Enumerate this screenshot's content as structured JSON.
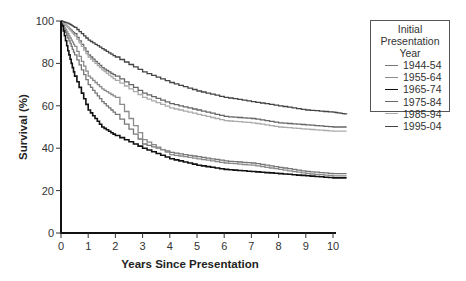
{
  "chart_data": {
    "type": "line",
    "title": "",
    "xlabel": "Years Since Presentation",
    "ylabel": "Survival (%)",
    "xlim": [
      0,
      10.5
    ],
    "ylim": [
      0,
      100
    ],
    "xticks": [
      "0",
      "1",
      "2",
      "3",
      "4",
      "5",
      "6",
      "7",
      "8",
      "9",
      "10"
    ],
    "yticks": [
      "0",
      "20",
      "40",
      "60",
      "80",
      "100"
    ],
    "grid": false,
    "legend_position": "upper right, outside plot",
    "legend_title": "Initial Presentation Year",
    "x": [
      0,
      0.25,
      0.5,
      1,
      1.5,
      2,
      3,
      4,
      5,
      6,
      7,
      8,
      9,
      10,
      10.5
    ],
    "series": [
      {
        "name": "1944-54",
        "color": "#777777",
        "values": [
          100,
          92,
          84,
          70,
          62,
          56,
          42,
          38,
          36,
          34,
          33,
          31,
          29,
          28,
          28
        ]
      },
      {
        "name": "1955-64",
        "color": "#8a8a8a",
        "values": [
          100,
          94,
          88,
          74,
          68,
          64,
          44,
          37,
          35,
          33,
          32,
          30,
          28,
          27,
          27
        ]
      },
      {
        "name": "1965-74",
        "color": "#111111",
        "values": [
          100,
          86,
          74,
          58,
          50,
          46,
          40,
          35,
          32,
          30,
          29,
          28,
          27,
          26,
          26
        ]
      },
      {
        "name": "1975-84",
        "color": "#666666",
        "values": [
          100,
          97,
          94,
          84,
          78,
          74,
          66,
          61,
          58,
          55,
          54,
          52,
          51,
          50,
          50
        ]
      },
      {
        "name": "1985-94",
        "color": "#aaaaaa",
        "values": [
          100,
          97,
          93,
          83,
          77,
          72,
          64,
          59,
          56,
          53,
          52,
          50,
          49,
          48,
          48
        ]
      },
      {
        "name": "1995-04",
        "color": "#444444",
        "values": [
          100,
          99,
          97,
          91,
          87,
          83,
          76,
          71,
          67,
          64,
          62,
          60,
          58,
          57,
          56
        ]
      }
    ]
  }
}
